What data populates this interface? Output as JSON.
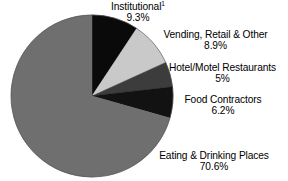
{
  "chart_data": {
    "type": "pie",
    "title": "",
    "subtitle": "",
    "xlabel": "",
    "ylabel": "",
    "legend_position": "none",
    "grid": false,
    "start_angle_deg": 0,
    "direction": "clockwise",
    "categories": [
      "Institutional",
      "Vending, Retail & Other",
      "Hotel/Motel Restaurants",
      "Food Contractors",
      "Eating & Drinking Places"
    ],
    "values": [
      9.3,
      8.9,
      5.0,
      6.2,
      70.6
    ],
    "value_labels": [
      "9.3%",
      "8.9%",
      "5%",
      "6.2%",
      "70.6%"
    ],
    "unit": "%",
    "slice_colors": [
      "#0a0a0a",
      "#c9c9c9",
      "#3c3c3c",
      "#121212",
      "#6f6f6f"
    ],
    "annotations": [
      "1"
    ]
  },
  "slices": [
    {
      "id": "institutional",
      "name": "Institutional",
      "name_superscript": "1",
      "value_label": "9.3%",
      "value": 9.3,
      "color": "#0a0a0a"
    },
    {
      "id": "vending",
      "name": "Vending, Retail & Other",
      "name_superscript": "",
      "value_label": "8.9%",
      "value": 8.9,
      "color": "#c9c9c9"
    },
    {
      "id": "hotel-motel",
      "name": "Hotel/Motel Restaurants",
      "name_superscript": "",
      "value_label": "5%",
      "value": 5.0,
      "color": "#3c3c3c"
    },
    {
      "id": "food-contractors",
      "name": "Food Contractors",
      "name_superscript": "",
      "value_label": "6.2%",
      "value": 6.2,
      "color": "#121212"
    },
    {
      "id": "eating-drinking",
      "name": "Eating & Drinking Places",
      "name_superscript": "",
      "value_label": "70.6%",
      "value": 70.6,
      "color": "#6f6f6f"
    }
  ],
  "geometry": {
    "center_x": 92,
    "center_y": 96,
    "radius": 81
  },
  "colors": {
    "background": "#ffffff",
    "text": "#000000",
    "outline": "#4a4a4a"
  }
}
